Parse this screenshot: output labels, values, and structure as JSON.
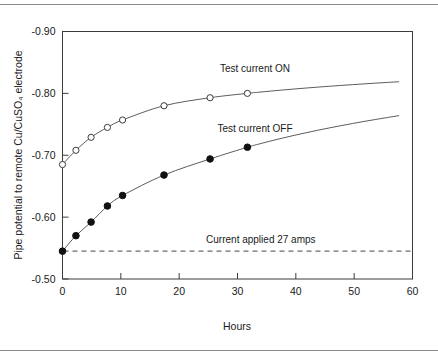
{
  "chart_data": {
    "type": "line",
    "title": "",
    "xlabel": "Hours",
    "ylabel": "Pipe potential to remote Cu/CuSO₄ electrode",
    "xlim": [
      0,
      60
    ],
    "ylim": [
      -0.9,
      -0.5
    ],
    "y_inverted": true,
    "grid": false,
    "xticks": [
      0,
      10,
      20,
      30,
      40,
      50,
      60
    ],
    "xticklabels": [
      "0",
      "10",
      "20",
      "30",
      "40",
      "50",
      "60"
    ],
    "yticks": [
      -0.9,
      -0.8,
      -0.7,
      -0.6,
      -0.5
    ],
    "yticklabels": [
      "-0.90",
      "-0.80",
      "-0.70",
      "-0.60",
      "-0.50"
    ],
    "legend_position": "inline-annotation",
    "series": [
      {
        "name": "Test current ON",
        "marker": "open-circle",
        "x": [
          0,
          2.3,
          4.9,
          7.7,
          10.3,
          17.4,
          25.3,
          31.7
        ],
        "y": [
          -0.685,
          -0.708,
          -0.729,
          -0.745,
          -0.757,
          -0.78,
          -0.793,
          -0.8
        ]
      },
      {
        "name": "Test current OFF",
        "marker": "filled-circle",
        "x": [
          0,
          2.3,
          4.9,
          7.7,
          10.3,
          17.4,
          25.3,
          31.7
        ],
        "y": [
          -0.545,
          -0.57,
          -0.592,
          -0.618,
          -0.635,
          -0.668,
          -0.694,
          -0.713
        ]
      }
    ],
    "annotations": [
      {
        "text": "Test current ON",
        "x": 33.0,
        "y": -0.835
      },
      {
        "text": "Test current OFF",
        "x": 33.0,
        "y": -0.737
      },
      {
        "text": "Current applied 27 amps",
        "x": 34.0,
        "y": -0.558
      }
    ],
    "reference_line": {
      "label": "Current applied 27 amps",
      "y": -0.545,
      "style": "dashed"
    }
  }
}
